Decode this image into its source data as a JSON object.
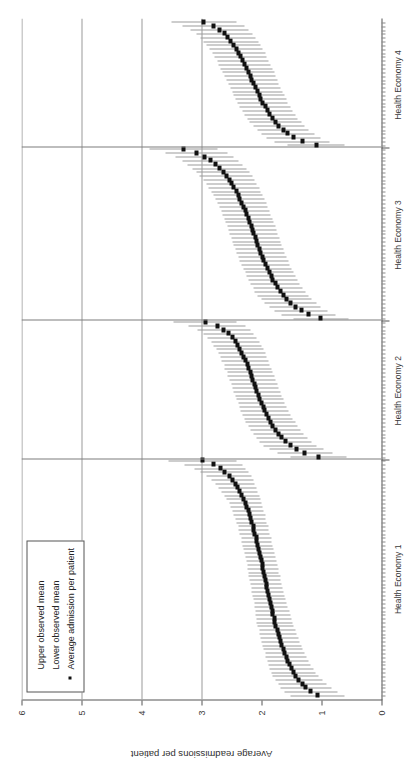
{
  "chart_data": {
    "type": "scatter",
    "title": "",
    "xlabel": "GP Practices",
    "ylabel": "Average readmissions per patient",
    "ylim": [
      0,
      6
    ],
    "yticks": [
      0,
      1,
      2,
      3,
      4,
      5,
      6
    ],
    "ytick_labels": [
      "0",
      "1",
      "2",
      "3",
      "4",
      "5",
      "6"
    ],
    "grid": "horizontal gridlines at y = 3, 4, 5, 6",
    "legend_position": "top-left inside plot area",
    "orientation": "figure rotated 90 degrees counter-clockwise in the screenshot",
    "marker": "small filled black square",
    "interval_style": "thin grey horizontal line from lower observed mean to upper observed mean",
    "groups": [
      {
        "label": "Health Economy 1",
        "n_practices": 62
      },
      {
        "label": "Health Economy 2",
        "n_practices": 36
      },
      {
        "label": "Health Economy 3",
        "n_practices": 45
      },
      {
        "label": "Health Economy 4",
        "n_practices": 33
      }
    ],
    "legend": [
      {
        "label": "Upper observed mean",
        "marker": "line-end"
      },
      {
        "label": "Lower observed mean",
        "marker": "line-end"
      },
      {
        "label": "Average admission per patient",
        "marker": "square"
      }
    ],
    "series": [
      {
        "name": "Health Economy 1",
        "mean": [
          1.07,
          1.18,
          1.26,
          1.32,
          1.38,
          1.43,
          1.47,
          1.5,
          1.53,
          1.56,
          1.59,
          1.61,
          1.64,
          1.66,
          1.68,
          1.7,
          1.72,
          1.74,
          1.76,
          1.78,
          1.79,
          1.81,
          1.82,
          1.84,
          1.85,
          1.87,
          1.88,
          1.9,
          1.91,
          1.92,
          1.94,
          1.95,
          1.96,
          1.98,
          1.99,
          2.0,
          2.02,
          2.03,
          2.05,
          2.06,
          2.08,
          2.09,
          2.11,
          2.13,
          2.14,
          2.16,
          2.18,
          2.2,
          2.22,
          2.25,
          2.27,
          2.3,
          2.33,
          2.36,
          2.4,
          2.44,
          2.49,
          2.54,
          2.61,
          2.69,
          2.8,
          2.98
        ],
        "lower": [
          0.62,
          0.74,
          0.84,
          0.92,
          0.99,
          1.05,
          1.1,
          1.14,
          1.18,
          1.22,
          1.25,
          1.28,
          1.31,
          1.34,
          1.36,
          1.39,
          1.41,
          1.44,
          1.46,
          1.48,
          1.5,
          1.52,
          1.54,
          1.56,
          1.58,
          1.6,
          1.61,
          1.63,
          1.65,
          1.66,
          1.68,
          1.69,
          1.71,
          1.72,
          1.74,
          1.75,
          1.77,
          1.78,
          1.8,
          1.81,
          1.83,
          1.84,
          1.86,
          1.88,
          1.89,
          1.91,
          1.93,
          1.94,
          1.96,
          1.98,
          2.0,
          2.02,
          2.04,
          2.06,
          2.08,
          2.11,
          2.14,
          2.17,
          2.21,
          2.26,
          2.32,
          2.41
        ],
        "upper": [
          1.52,
          1.62,
          1.68,
          1.72,
          1.77,
          1.81,
          1.84,
          1.86,
          1.88,
          1.9,
          1.93,
          1.94,
          1.97,
          1.98,
          2.0,
          2.01,
          2.03,
          2.04,
          2.06,
          2.08,
          2.08,
          2.1,
          2.1,
          2.12,
          2.12,
          2.14,
          2.15,
          2.17,
          2.17,
          2.18,
          2.2,
          2.21,
          2.21,
          2.24,
          2.24,
          2.25,
          2.27,
          2.28,
          2.3,
          2.31,
          2.33,
          2.34,
          2.36,
          2.38,
          2.39,
          2.41,
          2.43,
          2.46,
          2.48,
          2.52,
          2.54,
          2.58,
          2.62,
          2.66,
          2.72,
          2.77,
          2.84,
          2.91,
          3.01,
          3.12,
          3.28,
          3.55
        ]
      },
      {
        "name": "Health Economy 2",
        "mean": [
          1.05,
          1.28,
          1.42,
          1.52,
          1.6,
          1.66,
          1.72,
          1.77,
          1.81,
          1.85,
          1.88,
          1.92,
          1.95,
          1.97,
          2.0,
          2.03,
          2.05,
          2.08,
          2.1,
          2.12,
          2.15,
          2.17,
          2.19,
          2.22,
          2.24,
          2.27,
          2.3,
          2.33,
          2.36,
          2.4,
          2.44,
          2.49,
          2.55,
          2.63,
          2.74,
          2.94
        ],
        "lower": [
          0.58,
          0.82,
          0.97,
          1.08,
          1.17,
          1.24,
          1.3,
          1.35,
          1.4,
          1.44,
          1.48,
          1.52,
          1.55,
          1.58,
          1.61,
          1.64,
          1.66,
          1.69,
          1.71,
          1.74,
          1.76,
          1.78,
          1.81,
          1.83,
          1.86,
          1.88,
          1.91,
          1.94,
          1.97,
          2.0,
          2.04,
          2.08,
          2.13,
          2.19,
          2.27,
          2.41
        ],
        "upper": [
          1.52,
          1.74,
          1.87,
          1.96,
          2.03,
          2.08,
          2.14,
          2.19,
          2.22,
          2.26,
          2.28,
          2.32,
          2.35,
          2.36,
          2.39,
          2.42,
          2.44,
          2.47,
          2.49,
          2.5,
          2.54,
          2.56,
          2.57,
          2.61,
          2.62,
          2.66,
          2.69,
          2.72,
          2.75,
          2.8,
          2.84,
          2.9,
          2.97,
          3.07,
          3.21,
          3.47
        ]
      },
      {
        "name": "Health Economy 3",
        "mean": [
          1.01,
          1.21,
          1.34,
          1.44,
          1.52,
          1.58,
          1.64,
          1.69,
          1.73,
          1.77,
          1.81,
          1.84,
          1.87,
          1.9,
          1.93,
          1.96,
          1.98,
          2.01,
          2.03,
          2.06,
          2.08,
          2.1,
          2.13,
          2.15,
          2.17,
          2.2,
          2.22,
          2.25,
          2.27,
          2.3,
          2.33,
          2.36,
          2.39,
          2.42,
          2.46,
          2.5,
          2.54,
          2.59,
          2.64,
          2.7,
          2.77,
          2.85,
          2.95,
          3.08,
          3.3
        ],
        "lower": [
          0.55,
          0.76,
          0.9,
          1.01,
          1.09,
          1.16,
          1.22,
          1.27,
          1.32,
          1.36,
          1.4,
          1.43,
          1.47,
          1.5,
          1.53,
          1.55,
          1.58,
          1.61,
          1.63,
          1.66,
          1.68,
          1.7,
          1.73,
          1.75,
          1.77,
          1.8,
          1.82,
          1.85,
          1.87,
          1.9,
          1.92,
          1.95,
          1.98,
          2.01,
          2.04,
          2.08,
          2.11,
          2.15,
          2.2,
          2.25,
          2.31,
          2.38,
          2.46,
          2.56,
          2.73
        ],
        "upper": [
          1.47,
          1.66,
          1.78,
          1.87,
          1.95,
          2.0,
          2.06,
          2.11,
          2.14,
          2.18,
          2.22,
          2.25,
          2.27,
          2.3,
          2.33,
          2.37,
          2.38,
          2.41,
          2.43,
          2.46,
          2.48,
          2.5,
          2.53,
          2.55,
          2.57,
          2.6,
          2.62,
          2.65,
          2.67,
          2.7,
          2.74,
          2.77,
          2.8,
          2.83,
          2.88,
          2.92,
          2.97,
          3.03,
          3.08,
          3.15,
          3.23,
          3.32,
          3.44,
          3.6,
          3.87
        ]
      },
      {
        "name": "Health Economy 4",
        "mean": [
          1.09,
          1.32,
          1.46,
          1.56,
          1.64,
          1.71,
          1.77,
          1.82,
          1.86,
          1.9,
          1.94,
          1.98,
          2.01,
          2.04,
          2.07,
          2.1,
          2.13,
          2.16,
          2.19,
          2.22,
          2.25,
          2.28,
          2.31,
          2.35,
          2.38,
          2.42,
          2.46,
          2.51,
          2.56,
          2.62,
          2.7,
          2.8,
          2.96
        ],
        "lower": [
          0.62,
          0.86,
          1.01,
          1.12,
          1.21,
          1.28,
          1.34,
          1.4,
          1.44,
          1.48,
          1.52,
          1.56,
          1.59,
          1.62,
          1.65,
          1.68,
          1.71,
          1.74,
          1.77,
          1.79,
          1.82,
          1.85,
          1.88,
          1.91,
          1.94,
          1.98,
          2.01,
          2.05,
          2.1,
          2.15,
          2.21,
          2.29,
          2.42
        ],
        "upper": [
          1.56,
          1.78,
          1.91,
          2.0,
          2.07,
          2.14,
          2.2,
          2.24,
          2.28,
          2.32,
          2.36,
          2.4,
          2.43,
          2.46,
          2.49,
          2.52,
          2.55,
          2.58,
          2.61,
          2.65,
          2.68,
          2.71,
          2.74,
          2.79,
          2.82,
          2.86,
          2.91,
          2.97,
          3.02,
          3.09,
          3.19,
          3.31,
          3.5
        ]
      }
    ]
  },
  "axes": {
    "y_title": "Average readmissions per patient",
    "x_title": "GP Practices",
    "y_tick_labels": [
      "0",
      "1",
      "2",
      "3",
      "4",
      "5",
      "6"
    ],
    "x_group_labels": [
      "Health Economy 1",
      "Health Economy 2",
      "Health Economy 3",
      "Health Economy 4"
    ]
  },
  "legend": {
    "items": [
      {
        "label": "Upper observed mean",
        "key": "none"
      },
      {
        "label": "Lower observed mean",
        "key": "none"
      },
      {
        "label": "Average admission per patient",
        "key": "square"
      }
    ]
  },
  "colors": {
    "marker": "#111111",
    "interval": "#9b9b9b",
    "grid": "#9a9a9a",
    "axis": "#555555",
    "background": "#ffffff"
  }
}
